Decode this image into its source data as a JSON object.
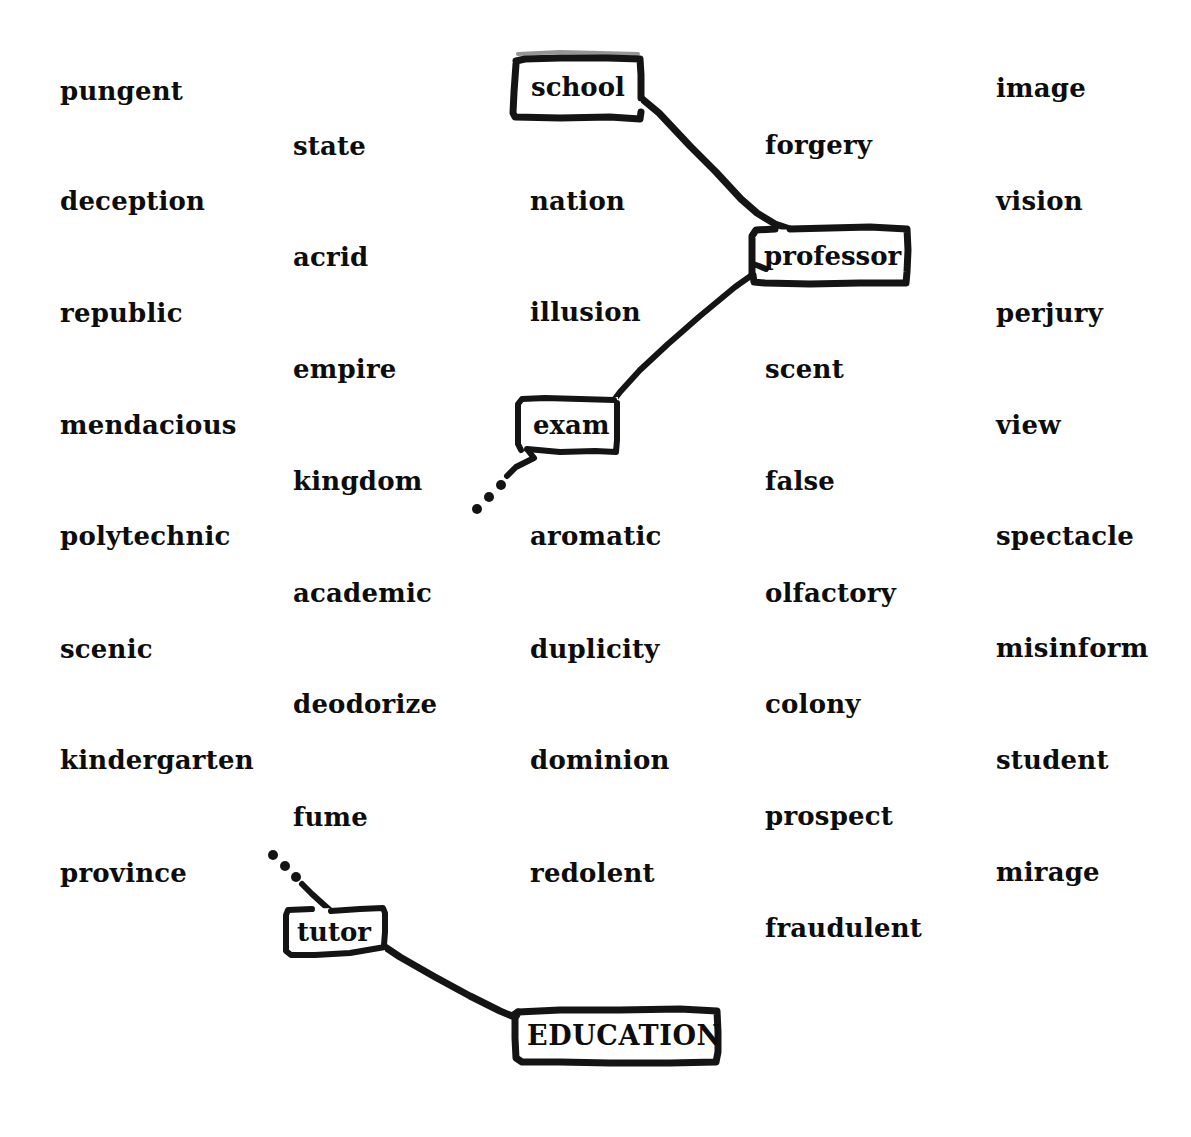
{
  "diagram": {
    "background_color": "#ffffff",
    "ink_color": "#141414",
    "text_color": "#0d0d0d"
  },
  "words": [
    {
      "text": "pungent",
      "x": 60,
      "y": 78
    },
    {
      "text": "state",
      "x": 293,
      "y": 133
    },
    {
      "text": "deception",
      "x": 60,
      "y": 188
    },
    {
      "text": "nation",
      "x": 530,
      "y": 188
    },
    {
      "text": "forgery",
      "x": 765,
      "y": 132
    },
    {
      "text": "image",
      "x": 996,
      "y": 75
    },
    {
      "text": "acrid",
      "x": 293,
      "y": 244
    },
    {
      "text": "vision",
      "x": 996,
      "y": 188
    },
    {
      "text": "republic",
      "x": 60,
      "y": 300
    },
    {
      "text": "illusion",
      "x": 530,
      "y": 299
    },
    {
      "text": "perjury",
      "x": 996,
      "y": 300
    },
    {
      "text": "empire",
      "x": 293,
      "y": 356
    },
    {
      "text": "scent",
      "x": 765,
      "y": 356
    },
    {
      "text": "mendacious",
      "x": 60,
      "y": 412
    },
    {
      "text": "view",
      "x": 996,
      "y": 412
    },
    {
      "text": "kingdom",
      "x": 293,
      "y": 468
    },
    {
      "text": "false",
      "x": 765,
      "y": 468
    },
    {
      "text": "polytechnic",
      "x": 60,
      "y": 523
    },
    {
      "text": "aromatic",
      "x": 530,
      "y": 523
    },
    {
      "text": "spectacle",
      "x": 996,
      "y": 523
    },
    {
      "text": "academic",
      "x": 293,
      "y": 580
    },
    {
      "text": "olfactory",
      "x": 765,
      "y": 580
    },
    {
      "text": "scenic",
      "x": 60,
      "y": 636
    },
    {
      "text": "duplicity",
      "x": 530,
      "y": 636
    },
    {
      "text": "misinform",
      "x": 996,
      "y": 635
    },
    {
      "text": "deodorize",
      "x": 293,
      "y": 691
    },
    {
      "text": "colony",
      "x": 765,
      "y": 691
    },
    {
      "text": "kindergarten",
      "x": 60,
      "y": 747
    },
    {
      "text": "dominion",
      "x": 530,
      "y": 747
    },
    {
      "text": "student",
      "x": 996,
      "y": 747
    },
    {
      "text": "fume",
      "x": 293,
      "y": 804
    },
    {
      "text": "prospect",
      "x": 765,
      "y": 803
    },
    {
      "text": "province",
      "x": 60,
      "y": 860
    },
    {
      "text": "redolent",
      "x": 530,
      "y": 860
    },
    {
      "text": "mirage",
      "x": 996,
      "y": 859
    },
    {
      "text": "fraudulent",
      "x": 765,
      "y": 915
    }
  ],
  "nodes": [
    {
      "id": "school",
      "label": "school",
      "label_x": 531,
      "label_y": 74,
      "box_x": 513,
      "box_y": 57,
      "box_w": 129,
      "box_h": 62
    },
    {
      "id": "professor",
      "label": "professor",
      "label_x": 764,
      "label_y": 243,
      "box_x": 751,
      "box_y": 227,
      "box_w": 158,
      "box_h": 57
    },
    {
      "id": "exam",
      "label": "exam",
      "label_x": 533,
      "label_y": 412,
      "box_x": 516,
      "box_y": 397,
      "box_w": 102,
      "box_h": 56
    },
    {
      "id": "tutor",
      "label": "tutor",
      "label_x": 297,
      "label_y": 919,
      "box_x": 284,
      "box_y": 906,
      "box_w": 101,
      "box_h": 50
    },
    {
      "id": "root",
      "label": "EDUCATION",
      "label_x": 527,
      "label_y": 1022,
      "box_x": 514,
      "box_y": 1009,
      "box_w": 205,
      "box_h": 55
    }
  ],
  "connectors": [
    {
      "id": "school-to-professor",
      "from": "school",
      "to": "professor",
      "style": "solid"
    },
    {
      "id": "professor-to-exam",
      "from": "professor",
      "to": "exam",
      "style": "solid"
    },
    {
      "id": "exam-to-unknown",
      "from": "exam",
      "to": "ellipsis",
      "style": "dotted"
    },
    {
      "id": "unknown-to-tutor",
      "from": "ellipsis",
      "to": "tutor",
      "style": "dotted"
    },
    {
      "id": "tutor-to-root",
      "from": "tutor",
      "to": "root",
      "style": "solid"
    }
  ],
  "ellipses": [
    {
      "id": "exam-ellipsis",
      "dots": [
        [
          477,
          509
        ],
        [
          489,
          497
        ],
        [
          501,
          485
        ]
      ]
    },
    {
      "id": "tutor-ellipsis",
      "dots": [
        [
          273,
          855
        ],
        [
          285,
          866
        ],
        [
          296,
          877
        ]
      ]
    }
  ]
}
